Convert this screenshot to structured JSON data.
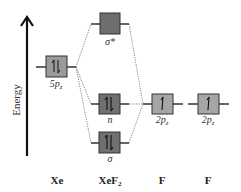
{
  "diagram": {
    "axis": {
      "label": "Energy"
    },
    "columns": [
      {
        "label": "Xe",
        "x": 57
      },
      {
        "label_main": "XeF",
        "label_sub": "2",
        "x": 110
      },
      {
        "label": "F",
        "x": 162
      },
      {
        "label": "F",
        "x": 208
      }
    ],
    "orbitals": [
      {
        "id": "xe-5pz",
        "label_main": "5p",
        "label_sub": "z",
        "electrons": 2,
        "fill": "#9a9a9a"
      },
      {
        "id": "sigma-star",
        "label": "σ*",
        "electrons": 0,
        "fill": "#6e6e6e"
      },
      {
        "id": "n",
        "label": "n",
        "electrons": 2,
        "fill": "#707070"
      },
      {
        "id": "sigma",
        "label": "σ",
        "electrons": 2,
        "fill": "#707070"
      },
      {
        "id": "f1-2pz",
        "label_main": "2p",
        "label_sub": "z",
        "electrons": 1,
        "fill": "#a6a6a6"
      },
      {
        "id": "f2-2pz",
        "label_main": "2p",
        "label_sub": "z",
        "electrons": 1,
        "fill": "#a6a6a6"
      }
    ],
    "colors": {
      "line": "#333333",
      "dotted": "#777777",
      "border": "#333333"
    }
  }
}
